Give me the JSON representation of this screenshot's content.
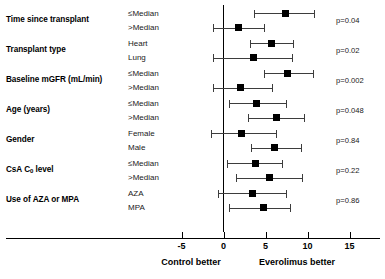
{
  "chart_data": {
    "type": "forest",
    "title": "",
    "xlabel": "",
    "ylabel": "",
    "xlim": [
      -7.5,
      18
    ],
    "xticks": [
      -5,
      0,
      5,
      10,
      15
    ],
    "xtick_labels": [
      "-5",
      "0",
      "5",
      "10",
      "15"
    ],
    "reference_line": 0,
    "grid": false,
    "legend": "none",
    "axis_captions": {
      "left": "Control better",
      "right": "Everolimus better"
    },
    "columns": {
      "factor": "",
      "level": "",
      "pvalue": ""
    },
    "groups": [
      {
        "factor": "Time since transplant",
        "pvalue": "p=0.04",
        "rows": [
          {
            "level": "≤Median",
            "estimate": 7.4,
            "ci_low": 3.6,
            "ci_high": 10.8
          },
          {
            "level": ">Median",
            "estimate": 1.8,
            "ci_low": -1.2,
            "ci_high": 4.8
          }
        ]
      },
      {
        "factor": "Transplant type",
        "pvalue": "p=0.02",
        "rows": [
          {
            "level": "Heart",
            "estimate": 5.7,
            "ci_low": 3.1,
            "ci_high": 8.3
          },
          {
            "level": "Lung",
            "estimate": 3.6,
            "ci_low": -1.2,
            "ci_high": 8.2
          }
        ]
      },
      {
        "factor": "Baseline mGFR (mL/min)",
        "pvalue": "p=0.002",
        "rows": [
          {
            "level": "≤Median",
            "estimate": 7.6,
            "ci_low": 4.8,
            "ci_high": 10.6
          },
          {
            "level": ">Median",
            "estimate": 2.0,
            "ci_low": -1.3,
            "ci_high": 5.8
          }
        ]
      },
      {
        "factor": "Age (years)",
        "pvalue": "p=0.048",
        "rows": [
          {
            "level": "≤Median",
            "estimate": 3.9,
            "ci_low": 0.7,
            "ci_high": 7.4
          },
          {
            "level": ">Median",
            "estimate": 6.3,
            "ci_low": 2.9,
            "ci_high": 9.6
          }
        ]
      },
      {
        "factor": "Gender",
        "pvalue": "p=0.84",
        "rows": [
          {
            "level": "Female",
            "estimate": 2.1,
            "ci_low": -1.5,
            "ci_high": 6.3
          },
          {
            "level": "Male",
            "estimate": 6.1,
            "ci_low": 3.3,
            "ci_high": 9.2
          }
        ]
      },
      {
        "factor": "CsA C0 level",
        "factor_prefix": "CsA C",
        "factor_sub": "0",
        "factor_suffix": " level",
        "pvalue": "p=0.22",
        "rows": [
          {
            "level": "≤Median",
            "estimate": 3.8,
            "ci_low": 0.4,
            "ci_high": 7.0
          },
          {
            "level": ">Median",
            "estimate": 5.5,
            "ci_low": 1.5,
            "ci_high": 9.3
          }
        ]
      },
      {
        "factor": "Use of AZA or MPA",
        "pvalue": "p=0.86",
        "rows": [
          {
            "level": "AZA",
            "estimate": 3.5,
            "ci_low": -0.7,
            "ci_high": 7.4
          },
          {
            "level": "MPA",
            "estimate": 4.8,
            "ci_low": 0.7,
            "ci_high": 7.9
          }
        ]
      }
    ]
  },
  "colors": {
    "marker": "#000000",
    "ci_line": "#3d3d3d",
    "axis": "#000000",
    "background": "#ffffff"
  }
}
